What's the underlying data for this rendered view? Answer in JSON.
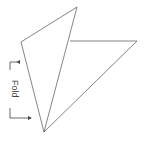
{
  "diagram": {
    "type": "fold-instruction",
    "label": "Fold",
    "stroke_color": "#666666",
    "shapes": [
      {
        "name": "left-triangle",
        "points": [
          [
            77,
            7
          ],
          [
            21,
            42
          ],
          [
            44,
            132
          ]
        ]
      },
      {
        "name": "right-triangle",
        "points": [
          [
            70,
            41
          ],
          [
            137,
            41
          ],
          [
            44,
            132
          ]
        ]
      }
    ],
    "fold_bracket": {
      "x": 10,
      "y_top": 62,
      "y_bottom": 118
    }
  }
}
